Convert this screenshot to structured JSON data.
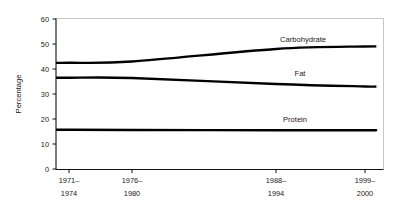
{
  "chart_data": {
    "type": "line",
    "title": "",
    "xlabel": "",
    "ylabel": "Percentage",
    "ylim": [
      0,
      60
    ],
    "ytick_values": [
      0,
      10,
      20,
      30,
      40,
      50,
      60
    ],
    "ytick_labels": [
      "0",
      "10",
      "20",
      "30",
      "40",
      "50",
      "60"
    ],
    "grid": false,
    "legend_position": "inline-labels",
    "categories": [
      "1971-1974",
      "1976-1980",
      "1988-1994",
      "1999-2000"
    ],
    "xtick_labels": [
      {
        "line1": "1971–",
        "line2": "1974"
      },
      {
        "line1": "1976–",
        "line2": "1980"
      },
      {
        "line1": "1988–",
        "line2": "1994"
      },
      {
        "line1": "1999–",
        "line2": "2000"
      }
    ],
    "series": [
      {
        "name": "Carbohydrate",
        "values": [
          42.5,
          43.0,
          48.0,
          49.0
        ],
        "color": "#000000"
      },
      {
        "name": "Fat",
        "values": [
          36.5,
          36.4,
          34.0,
          33.0
        ],
        "color": "#000000"
      },
      {
        "name": "Protein",
        "values": [
          15.7,
          15.6,
          15.5,
          15.5
        ],
        "color": "#000000"
      }
    ],
    "annotations": [
      {
        "text": "Carbohydrate",
        "series": "Carbohydrate"
      },
      {
        "text": "Fat",
        "series": "Fat"
      },
      {
        "text": "Protein",
        "series": "Protein"
      }
    ]
  },
  "axes": {
    "y_axis_title": "Percentage"
  }
}
